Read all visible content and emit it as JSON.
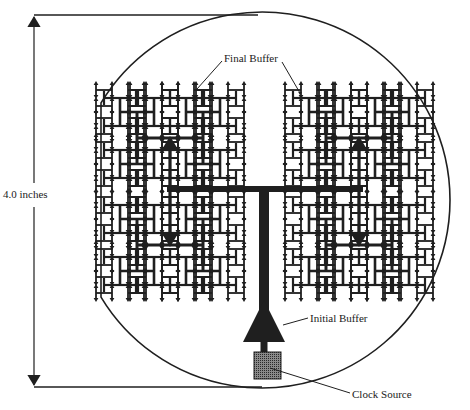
{
  "figure": {
    "width": 470,
    "height": 410,
    "colors": {
      "ink": "#1f1f1f",
      "background": "#ffffff",
      "clock_source_fill": "#6a6a6a"
    }
  },
  "labels": {
    "dimension": "4.0 inches",
    "final_buffer": "Final Buffer",
    "initial_buffer": "Initial Buffer",
    "clock_source": "Clock Source"
  },
  "dimension_marker": {
    "x": 34,
    "top_y": 15,
    "bottom_y": 387,
    "top_line_end_x": 258,
    "bottom_line_end_x": 262,
    "label_y": 195
  },
  "wafer": {
    "center_x": 262,
    "center_y": 200,
    "radius": 188,
    "flat_x": 101
  },
  "trunk": {
    "x": 264,
    "top_y": 189,
    "bottom_y": 352,
    "width": 10,
    "initial_buffer": {
      "apex_y": 300,
      "base_y": 342,
      "half_width": 21
    },
    "clock_source": {
      "x": 254,
      "y": 352,
      "w": 27,
      "h": 27
    }
  },
  "htree": {
    "main_bar": {
      "y": 189,
      "x1": 170,
      "x2": 360,
      "width": 6
    },
    "quadrants": [
      {
        "name": "top-left",
        "cx": 170,
        "cy": 138,
        "arrow": "up"
      },
      {
        "name": "bottom-left",
        "cx": 170,
        "cy": 245,
        "arrow": "down"
      },
      {
        "name": "top-right",
        "cx": 359,
        "cy": 138,
        "arrow": "up"
      },
      {
        "name": "bottom-right",
        "cx": 359,
        "cy": 245,
        "arrow": "down"
      }
    ],
    "quadrant_half_width": 33,
    "quadrant_half_height": 26,
    "cluster_half_width": 16,
    "cluster_half_height": 13,
    "leaf_half_width": 8,
    "leaf_half_height": 7
  }
}
